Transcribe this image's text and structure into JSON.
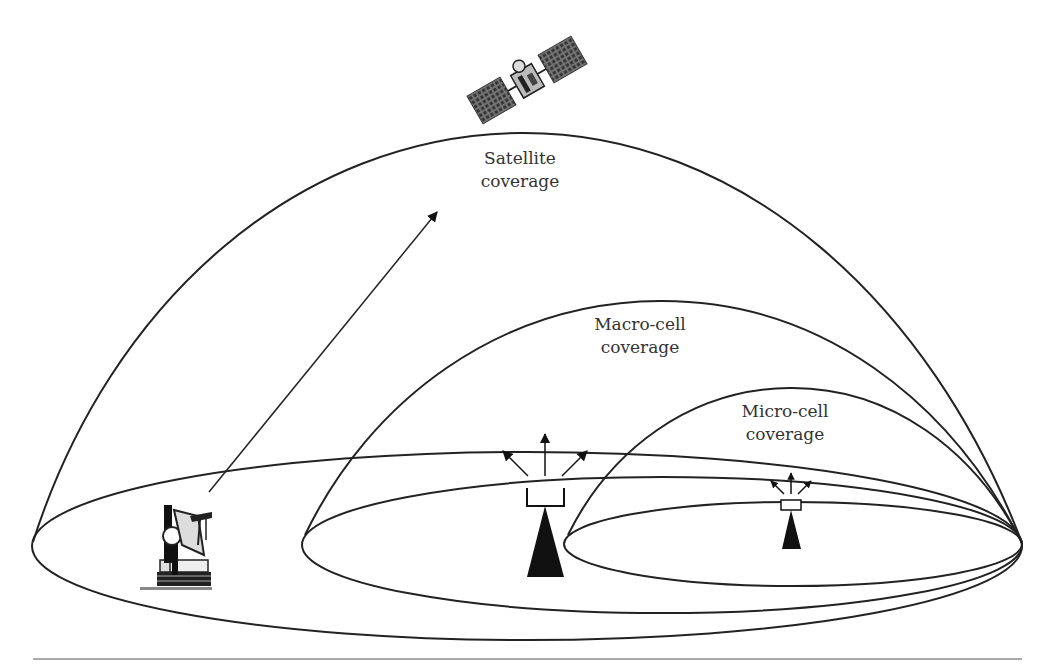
{
  "diagram": {
    "type": "coverage-hierarchy",
    "colors": {
      "background": "#ffffff",
      "stroke": "#222222",
      "text": "#333333",
      "panel": "#555555"
    },
    "labels": {
      "satellite": {
        "line1": "Satellite",
        "line2": "coverage"
      },
      "macro": {
        "line1": "Macro-cell",
        "line2": "coverage"
      },
      "micro": {
        "line1": "Micro-cell",
        "line2": "coverage"
      }
    },
    "icons": {
      "satellite": "satellite-icon",
      "ground_station": "ground-station-dish-icon",
      "macro_tower": "macro-cell-tower-icon",
      "micro_tower": "micro-cell-tower-icon",
      "uplink_arrow": "uplink-arrow-icon"
    },
    "regions": [
      {
        "name": "satellite-coverage",
        "ellipse": {
          "cx": 527,
          "cy": 546,
          "rx": 495,
          "ry": 94
        },
        "dome_peak": [
          520,
          133
        ]
      },
      {
        "name": "macro-cell-coverage",
        "ellipse": {
          "cx": 662,
          "cy": 545,
          "rx": 360,
          "ry": 68
        },
        "dome_peak": [
          660,
          301
        ]
      },
      {
        "name": "micro-cell-coverage",
        "ellipse": {
          "cx": 793,
          "cy": 544,
          "rx": 229,
          "ry": 42
        },
        "dome_peak": [
          790,
          388
        ]
      }
    ]
  }
}
